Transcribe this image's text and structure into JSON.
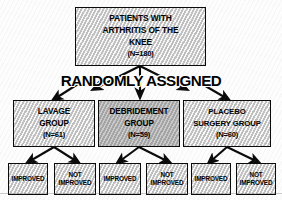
{
  "diagram": {
    "randomization_label": "RANDOMLY ASSIGNED",
    "colors": {
      "border": "#0a0a0a",
      "box_fill_light": "#d3d3d3",
      "box_fill_dark": "#b4b4b4",
      "text": "#000000",
      "background": "#fdfdfd"
    }
  },
  "root": {
    "line1": "PATIENTS WITH",
    "line2": "ARTHRITIS OF THE",
    "line3": "KNEE",
    "n": "(N=180)",
    "count": 180
  },
  "groups": [
    {
      "id": "lavage",
      "line1": "LAVAGE",
      "line2": "GROUP",
      "n": "(N=61)",
      "count": 61,
      "fill": "light",
      "outcomes": [
        {
          "id": "lavage-improved",
          "line1": "IMPROVED",
          "line2": ""
        },
        {
          "id": "lavage-not-improved",
          "line1": "NOT",
          "line2": "IMPROVED"
        }
      ]
    },
    {
      "id": "debridement",
      "line1": "DEBRIDEMENT",
      "line2": "GROUP",
      "n": "(N=59)",
      "count": 59,
      "fill": "dark",
      "outcomes": [
        {
          "id": "debridement-improved",
          "line1": "IMPROVED",
          "line2": ""
        },
        {
          "id": "debridement-not-improved",
          "line1": "NOT",
          "line2": "IMPROVED"
        }
      ]
    },
    {
      "id": "placebo",
      "line1": "PLACEBO",
      "line2": "SURGERY GROUP",
      "n": "(N=60)",
      "count": 60,
      "fill": "light",
      "outcomes": [
        {
          "id": "placebo-improved",
          "line1": "IMPROVED",
          "line2": ""
        },
        {
          "id": "placebo-not-improved",
          "line1": "NOT",
          "line2": "IMPROVED"
        }
      ]
    }
  ]
}
